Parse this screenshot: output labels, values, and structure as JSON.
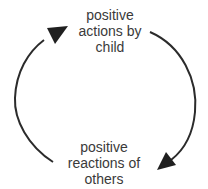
{
  "diagram": {
    "type": "cycle",
    "nodes": [
      {
        "id": "top",
        "lines": [
          "positive",
          "actions by",
          "child"
        ]
      },
      {
        "id": "bottom",
        "lines": [
          "positive",
          "reactions of",
          "others"
        ]
      }
    ],
    "edges": [
      {
        "from": "top",
        "to": "bottom",
        "side": "right"
      },
      {
        "from": "bottom",
        "to": "top",
        "side": "left"
      }
    ],
    "colors": {
      "stroke": "#2b2b2b",
      "text": "#3a3a3a",
      "background": "#ffffff"
    }
  }
}
